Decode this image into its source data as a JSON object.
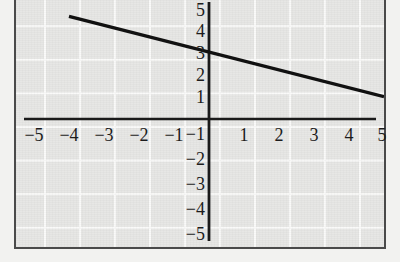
{
  "figure": {
    "kind": "cartesian-line-graph",
    "background_color": "#e7e7e5",
    "grid_color": "#fbfbfa",
    "axis_color": "#1a1a1a",
    "line_color": "#111111",
    "frame_color": "#4a4a4a"
  },
  "chart_data": {
    "type": "line",
    "title": "",
    "subtitle": "",
    "xlabel": "",
    "ylabel": "",
    "xlim": [
      -5,
      5
    ],
    "ylim": [
      -5,
      5
    ],
    "grid": true,
    "legend": null,
    "legend_position": "none",
    "x_ticks": [
      -5,
      -4,
      -3,
      -2,
      -1,
      1,
      2,
      3,
      4,
      5
    ],
    "y_ticks": [
      5,
      4,
      3,
      2,
      1,
      -1,
      -2,
      -3,
      -4,
      -5
    ],
    "x_tick_labels": [
      "−5",
      "−4",
      "−3",
      "−2",
      "−1",
      "1",
      "2",
      "3",
      "4",
      "5"
    ],
    "y_tick_labels": [
      "5",
      "4",
      "3",
      "2",
      "1",
      "−1",
      "−2",
      "−3",
      "−4",
      "−5"
    ],
    "series": [
      {
        "name": "line",
        "equation": "y = -0.4x + 3",
        "slope": -0.4,
        "y_intercept": 3,
        "x_intercept": 7.5,
        "points": [
          {
            "x": -4,
            "y": 4.6
          },
          {
            "x": 0,
            "y": 3
          },
          {
            "x": 5,
            "y": 1
          }
        ],
        "segment_start": {
          "x": -4,
          "y": 4.6
        },
        "segment_end": {
          "x": 5,
          "y": 1
        }
      }
    ]
  },
  "axes": {
    "x_axis_name": "x-axis",
    "y_axis_name": "y-axis",
    "origin": {
      "x": 0,
      "y": 0
    }
  }
}
